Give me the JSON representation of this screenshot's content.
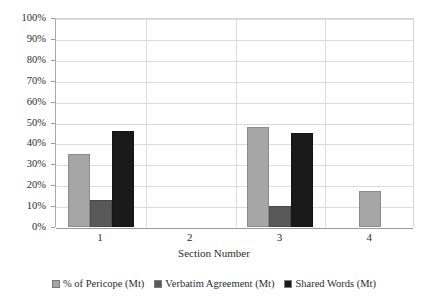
{
  "chart_data": {
    "type": "bar",
    "title": "",
    "xlabel": "Section Number",
    "ylabel": "",
    "categories": [
      "1",
      "2",
      "3",
      "4"
    ],
    "ylim": [
      0,
      100
    ],
    "ytick_labels": [
      "100%",
      "90%",
      "80%",
      "70%",
      "60%",
      "50%",
      "40%",
      "30%",
      "20%",
      "10%",
      "0%"
    ],
    "ytick_values": [
      100,
      90,
      80,
      70,
      60,
      50,
      40,
      30,
      20,
      10,
      0
    ],
    "grid": true,
    "legend_position": "bottom",
    "series": [
      {
        "name": "% of Pericope (Mt)",
        "color": "#a6a6a6",
        "values": [
          35,
          0,
          48,
          17
        ]
      },
      {
        "name": "Verbatim Agreement (Mt)",
        "color": "#595959",
        "values": [
          13,
          0,
          10,
          0
        ]
      },
      {
        "name": "Shared Words (Mt)",
        "color": "#1a1a1a",
        "values": [
          46,
          0,
          45,
          0
        ]
      }
    ]
  },
  "axes": {
    "x_title": "Section Number"
  },
  "legend": {
    "items": [
      {
        "label": "% of Pericope (Mt)",
        "swatch": "light-gray-swatch-icon"
      },
      {
        "label": "Verbatim Agreement (Mt)",
        "swatch": "medium-gray-swatch-icon"
      },
      {
        "label": "Shared Words (Mt)",
        "swatch": "black-swatch-icon"
      }
    ]
  }
}
